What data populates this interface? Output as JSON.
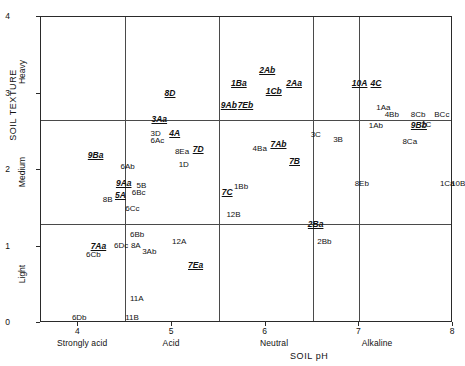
{
  "chart_data": {
    "type": "scatter",
    "title": "",
    "xlabel": "SOIL pH",
    "ylabel": "SOIL TEXTURE",
    "xlim": [
      3.6,
      8.0
    ],
    "ylim": [
      0,
      4
    ],
    "grid": true,
    "x_ticks": [
      "4",
      "5",
      "6",
      "7",
      "8"
    ],
    "x_tick_values": [
      4,
      5,
      6,
      7,
      8
    ],
    "x_band_labels": [
      "Strongly acid",
      "Acid",
      "Neutral",
      "Alkaline"
    ],
    "x_band_centers": [
      4.05,
      5.0,
      6.1,
      7.2
    ],
    "y_ticks": [
      "0",
      "1",
      "2",
      "3",
      "4"
    ],
    "y_tick_values": [
      0,
      1,
      2,
      3,
      4
    ],
    "y_band_labels": [
      "Light",
      "Medium",
      "Heavy"
    ],
    "y_band_centers": [
      0.62,
      1.95,
      3.25
    ],
    "vertical_gridlines": [
      4.5,
      5.5,
      6.5,
      7.0
    ],
    "horizontal_gridlines": [
      1.3,
      2.65
    ],
    "points": [
      {
        "label": "8D",
        "x": 4.92,
        "y": 3.0,
        "emphasis": true
      },
      {
        "label": "2Ab",
        "x": 5.93,
        "y": 3.3,
        "emphasis": true
      },
      {
        "label": "1Ba",
        "x": 5.63,
        "y": 3.12,
        "emphasis": true
      },
      {
        "label": "1Cb",
        "x": 6.0,
        "y": 3.02,
        "emphasis": true
      },
      {
        "label": "2Aa",
        "x": 6.22,
        "y": 3.12,
        "emphasis": true
      },
      {
        "label": "10A",
        "x": 6.92,
        "y": 3.12,
        "emphasis": true
      },
      {
        "label": "4C",
        "x": 7.12,
        "y": 3.12,
        "emphasis": true
      },
      {
        "label": "9Ab",
        "x": 5.52,
        "y": 2.84,
        "emphasis": true
      },
      {
        "label": "7Eb",
        "x": 5.7,
        "y": 2.84,
        "emphasis": true
      },
      {
        "label": "1Aa",
        "x": 7.18,
        "y": 2.8,
        "emphasis": false
      },
      {
        "label": "4Bb",
        "x": 7.27,
        "y": 2.7,
        "emphasis": false
      },
      {
        "label": "8Cb",
        "x": 7.55,
        "y": 2.7,
        "emphasis": false
      },
      {
        "label": "BCc",
        "x": 7.8,
        "y": 2.7,
        "emphasis": false
      },
      {
        "label": "3Aa",
        "x": 4.78,
        "y": 2.65,
        "emphasis": true
      },
      {
        "label": "1Ab",
        "x": 7.1,
        "y": 2.56,
        "emphasis": false
      },
      {
        "label": "9Bb",
        "x": 7.55,
        "y": 2.58,
        "emphasis": true
      },
      {
        "label": "2C",
        "x": 7.66,
        "y": 2.58,
        "emphasis": false
      },
      {
        "label": "3D",
        "x": 4.77,
        "y": 2.46,
        "emphasis": false
      },
      {
        "label": "4A",
        "x": 4.97,
        "y": 2.47,
        "emphasis": true
      },
      {
        "label": "6Ac",
        "x": 4.77,
        "y": 2.37,
        "emphasis": false
      },
      {
        "label": "3C",
        "x": 6.48,
        "y": 2.44,
        "emphasis": false
      },
      {
        "label": "3B",
        "x": 6.72,
        "y": 2.38,
        "emphasis": false
      },
      {
        "label": "8Ca",
        "x": 7.46,
        "y": 2.35,
        "emphasis": false
      },
      {
        "label": "7Ab",
        "x": 6.05,
        "y": 2.33,
        "emphasis": true
      },
      {
        "label": "4Ba",
        "x": 5.86,
        "y": 2.26,
        "emphasis": false
      },
      {
        "label": "8Ea",
        "x": 5.03,
        "y": 2.22,
        "emphasis": false
      },
      {
        "label": "7D",
        "x": 5.22,
        "y": 2.26,
        "emphasis": true
      },
      {
        "label": "9Ba",
        "x": 4.1,
        "y": 2.18,
        "emphasis": true
      },
      {
        "label": "7B",
        "x": 6.25,
        "y": 2.1,
        "emphasis": true
      },
      {
        "label": "1D",
        "x": 5.07,
        "y": 2.05,
        "emphasis": false
      },
      {
        "label": "6Ab",
        "x": 4.45,
        "y": 2.02,
        "emphasis": false
      },
      {
        "label": "8Eb",
        "x": 6.95,
        "y": 1.8,
        "emphasis": false
      },
      {
        "label": "1Ca",
        "x": 7.86,
        "y": 1.8,
        "emphasis": false
      },
      {
        "label": "10B",
        "x": 7.98,
        "y": 1.8,
        "emphasis": false
      },
      {
        "label": "9Aa",
        "x": 4.4,
        "y": 1.82,
        "emphasis": true
      },
      {
        "label": "5B",
        "x": 4.62,
        "y": 1.78,
        "emphasis": false
      },
      {
        "label": "6Bc",
        "x": 4.57,
        "y": 1.68,
        "emphasis": false
      },
      {
        "label": "5A",
        "x": 4.39,
        "y": 1.66,
        "emphasis": true
      },
      {
        "label": "8B",
        "x": 4.26,
        "y": 1.6,
        "emphasis": false
      },
      {
        "label": "7C",
        "x": 5.53,
        "y": 1.7,
        "emphasis": true
      },
      {
        "label": "1Bb",
        "x": 5.66,
        "y": 1.77,
        "emphasis": false
      },
      {
        "label": "6Cc",
        "x": 4.5,
        "y": 1.48,
        "emphasis": false
      },
      {
        "label": "12B",
        "x": 5.58,
        "y": 1.4,
        "emphasis": false
      },
      {
        "label": "2Ba",
        "x": 6.45,
        "y": 1.28,
        "emphasis": true
      },
      {
        "label": "6Bb",
        "x": 4.55,
        "y": 1.14,
        "emphasis": false
      },
      {
        "label": "12A",
        "x": 5.0,
        "y": 1.05,
        "emphasis": false
      },
      {
        "label": "2Bb",
        "x": 6.55,
        "y": 1.05,
        "emphasis": false
      },
      {
        "label": "7Aa",
        "x": 4.13,
        "y": 1.0,
        "emphasis": true
      },
      {
        "label": "6Dc",
        "x": 4.38,
        "y": 1.0,
        "emphasis": false
      },
      {
        "label": "8A",
        "x": 4.56,
        "y": 1.0,
        "emphasis": false
      },
      {
        "label": "3Ab",
        "x": 4.68,
        "y": 0.92,
        "emphasis": false
      },
      {
        "label": "6Cb",
        "x": 4.08,
        "y": 0.88,
        "emphasis": false
      },
      {
        "label": "7Ea",
        "x": 5.17,
        "y": 0.74,
        "emphasis": true
      },
      {
        "label": "11A",
        "x": 4.55,
        "y": 0.3,
        "emphasis": false
      },
      {
        "label": "6Db",
        "x": 3.93,
        "y": 0.05,
        "emphasis": false
      },
      {
        "label": "11B",
        "x": 4.5,
        "y": 0.05,
        "emphasis": false
      }
    ]
  }
}
